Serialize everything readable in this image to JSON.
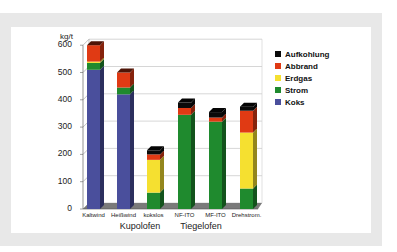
{
  "chart_data": {
    "type": "bar",
    "stacked": true,
    "three_d": true,
    "title": "",
    "ylabel": "kg/t",
    "xlabel": "",
    "ylim": [
      0,
      600
    ],
    "yticks": [
      "0",
      "100",
      "200",
      "300",
      "400",
      "500",
      "600"
    ],
    "categories": [
      "Kaltwind",
      "Heißwind",
      "kokslos",
      "NF-ITO",
      "MF-ITO",
      "Drehstrom."
    ],
    "groups": [
      {
        "label": "Kupolofen",
        "categories": [
          "Kaltwind",
          "Heißwind",
          "kokslos"
        ]
      },
      {
        "label": "Tiegelofen",
        "categories": [
          "NF-ITO",
          "MF-ITO",
          "Drehstrom."
        ]
      }
    ],
    "series": [
      {
        "name": "Koks",
        "color": "#4a4f9c",
        "values": [
          510,
          420,
          0,
          0,
          0,
          0
        ]
      },
      {
        "name": "Strom",
        "color": "#1f8a2e",
        "values": [
          25,
          25,
          60,
          345,
          320,
          75
        ]
      },
      {
        "name": "Erdgas",
        "color": "#f5e030",
        "values": [
          5,
          0,
          120,
          0,
          0,
          205
        ]
      },
      {
        "name": "Abbrand",
        "color": "#e03a14",
        "values": [
          60,
          55,
          20,
          25,
          15,
          80
        ]
      },
      {
        "name": "Aufkohlung",
        "color": "#0a0a0a",
        "values": [
          0,
          0,
          15,
          20,
          20,
          15
        ]
      }
    ],
    "legend": {
      "position": "right",
      "order": [
        "Aufkohlung",
        "Abbrand",
        "Erdgas",
        "Strom",
        "Koks"
      ]
    },
    "grid": true
  },
  "axis": {
    "unit": "kg/t",
    "ticks": [
      "0",
      "100",
      "200",
      "300",
      "400",
      "500",
      "600"
    ]
  },
  "xaxis": {
    "categories": [
      "Kaltwind",
      "Heißwind",
      "kokslos",
      "NF-ITO",
      "MF-ITO",
      "Drehstrom."
    ],
    "groups": [
      "Kupolofen",
      "Tiegelofen"
    ]
  },
  "legend": {
    "items": [
      {
        "label": "Aufkohlung",
        "color": "#0a0a0a"
      },
      {
        "label": "Abbrand",
        "color": "#e03a14"
      },
      {
        "label": "Erdgas",
        "color": "#f5e030"
      },
      {
        "label": "Strom",
        "color": "#1f8a2e"
      },
      {
        "label": "Koks",
        "color": "#4a4f9c"
      }
    ]
  }
}
